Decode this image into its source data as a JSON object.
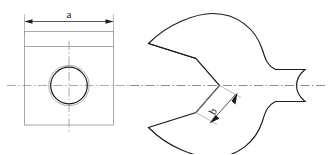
{
  "drawing": {
    "title": "Open-end wrench head technical drawing",
    "background_color": "#ffffff",
    "line_color": "#1c1c1c",
    "thin_line_color": "#8a8a8a",
    "centerline_color": "#8d8d8d",
    "views": [
      {
        "name": "front-view-square-plate",
        "description": "Square plate with concentric bore"
      },
      {
        "name": "side-view-wrench-head",
        "description": "Open-end wrench jaw profile"
      }
    ],
    "dimensions": [
      {
        "id": "a",
        "label": "a",
        "view": "front-view-square-plate",
        "orientation": "horizontal",
        "placement": "above",
        "arrow_style": "filled-closed-both-ends"
      },
      {
        "id": "b",
        "label": "b",
        "view": "side-view-wrench-head",
        "orientation": "diagonal",
        "rotation_degrees": -62,
        "arrow_style": "filled-closed-both-ends"
      }
    ],
    "features": {
      "bore": {
        "name": "through-bore",
        "style": "two-concentric-circles"
      },
      "jaw": {
        "name": "wrench-jaw-opening",
        "style": "open-end"
      }
    }
  }
}
